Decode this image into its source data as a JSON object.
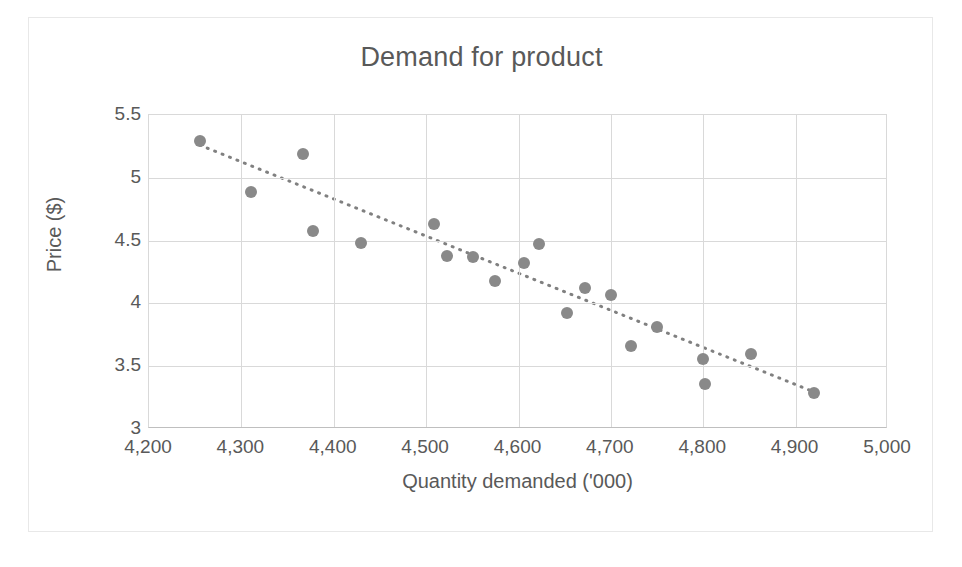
{
  "chart_data": {
    "type": "scatter",
    "title": "Demand for product",
    "xlabel": "Quantity demanded ('000)",
    "ylabel": "Price ($)",
    "xlim": [
      4200,
      5000
    ],
    "ylim": [
      3,
      5.5
    ],
    "xticks": [
      4200,
      4300,
      4400,
      4500,
      4600,
      4700,
      4800,
      4900,
      5000
    ],
    "xtick_labels": [
      "4,200",
      "4,300",
      "4,400",
      "4,500",
      "4,600",
      "4,700",
      "4,800",
      "4,900",
      "5,000"
    ],
    "yticks": [
      3,
      3.5,
      4,
      4.5,
      5,
      5.5
    ],
    "ytick_labels": [
      "3",
      "3.5",
      "4",
      "4.5",
      "5",
      "5.5"
    ],
    "grid": true,
    "legend": false,
    "marker_color": "#898989",
    "trendline_color": "#808080",
    "trendline_style": "dotted",
    "trendline": {
      "x0": 4255,
      "y0": 5.26,
      "x1": 4925,
      "y1": 3.28
    },
    "points": [
      {
        "x": 4255,
        "y": 5.29
      },
      {
        "x": 4310,
        "y": 4.89
      },
      {
        "x": 4367,
        "y": 5.19
      },
      {
        "x": 4378,
        "y": 4.58
      },
      {
        "x": 4430,
        "y": 4.48
      },
      {
        "x": 4508,
        "y": 4.63
      },
      {
        "x": 4523,
        "y": 4.38
      },
      {
        "x": 4551,
        "y": 4.37
      },
      {
        "x": 4575,
        "y": 4.18
      },
      {
        "x": 4606,
        "y": 4.32
      },
      {
        "x": 4622,
        "y": 4.47
      },
      {
        "x": 4652,
        "y": 3.92
      },
      {
        "x": 4672,
        "y": 4.12
      },
      {
        "x": 4700,
        "y": 4.07
      },
      {
        "x": 4722,
        "y": 3.66
      },
      {
        "x": 4750,
        "y": 3.81
      },
      {
        "x": 4800,
        "y": 3.56
      },
      {
        "x": 4802,
        "y": 3.36
      },
      {
        "x": 4852,
        "y": 3.6
      },
      {
        "x": 4920,
        "y": 3.29
      }
    ]
  }
}
